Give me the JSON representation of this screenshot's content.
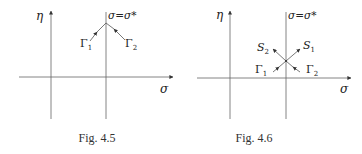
{
  "figures": [
    {
      "id": "fig-4-5",
      "caption": "Fig. 4.5",
      "axis_labels": {
        "y": "η",
        "x": "σ"
      },
      "line_label": "σ=σ*",
      "curve_labels": {
        "gamma1": "Γ",
        "gamma1_sub": "1",
        "gamma2": "Γ",
        "gamma2_sub": "2"
      }
    },
    {
      "id": "fig-4-6",
      "caption": "Fig. 4.6",
      "axis_labels": {
        "y": "η",
        "x": "σ"
      },
      "line_label": "σ=σ*",
      "curve_labels": {
        "gamma1": "Γ",
        "gamma1_sub": "1",
        "gamma2": "Γ",
        "gamma2_sub": "2",
        "s1": "S",
        "s1_sub": "1",
        "s2": "S",
        "s2_sub": "2"
      }
    }
  ],
  "colors": {
    "stroke": "#555555",
    "text": "#222222",
    "background": "#ffffff"
  }
}
